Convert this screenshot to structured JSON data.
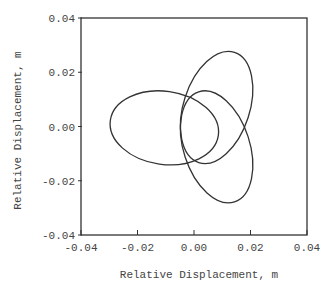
{
  "chart_data": {
    "type": "line",
    "title": "",
    "xlabel": "Relative Displacement, m",
    "ylabel": "Relative Displacement, m",
    "xlim": [
      -0.04,
      0.04
    ],
    "ylim": [
      -0.04,
      0.04
    ],
    "xticks": [
      -0.04,
      -0.02,
      0.0,
      0.02,
      0.04
    ],
    "yticks": [
      -0.04,
      -0.02,
      0.0,
      0.02,
      0.04
    ],
    "xtick_labels": [
      "-0.04",
      "-0.02",
      "0.00",
      "0.02",
      "0.04"
    ],
    "ytick_labels": [
      "-0.04",
      "-0.02",
      "0.00",
      "0.02",
      "0.04"
    ],
    "grid": false,
    "legend": null,
    "series": [
      {
        "name": "three-lobed orbit",
        "shape": "trefoil (three overlapping elliptical lobes)",
        "lobes": [
          {
            "name": "left-lobe",
            "center": [
              -0.0105,
              -0.0005
            ],
            "semi_major": 0.0193,
            "semi_minor": 0.0135,
            "rotation_deg": -8
          },
          {
            "name": "upper-right-lobe",
            "center": [
              0.008,
              0.007
            ],
            "semi_major": 0.0205,
            "semi_minor": 0.0122,
            "rotation_deg": 72
          },
          {
            "name": "lower-right-lobe",
            "center": [
              0.008,
              -0.0075
            ],
            "semi_major": 0.0205,
            "semi_minor": 0.0122,
            "rotation_deg": -72
          }
        ],
        "key_points": {
          "leftmost": [
            -0.0297,
            0.0
          ],
          "topmost": [
            0.009,
            0.027
          ],
          "bottommost": [
            0.009,
            -0.028
          ],
          "rightmost": [
            0.02,
            0.0
          ],
          "crossings": [
            [
              -0.008,
              0.0135
            ],
            [
              -0.008,
              -0.0135
            ],
            [
              0.0145,
              0.0
            ]
          ]
        },
        "color": "#333333"
      }
    ]
  },
  "style": {
    "axis_color": "#333333",
    "line_color": "#333333",
    "background": "#ffffff"
  }
}
